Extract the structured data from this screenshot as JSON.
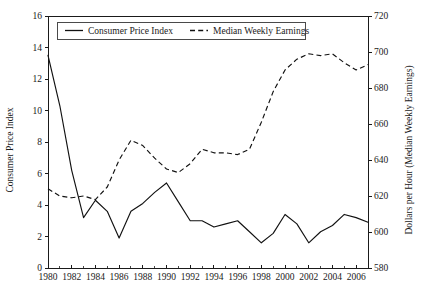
{
  "chart_data": {
    "type": "line",
    "title": "",
    "subtitle": "",
    "xlabel": "",
    "ylabel": "Consumer Price Index",
    "y2label": "Dollars per Hour (Median Weekly Earnings)",
    "grid": false,
    "legend_position": "top-center",
    "xlim": [
      1980,
      2007
    ],
    "ylim": [
      0,
      16
    ],
    "y2lim": [
      580,
      720
    ],
    "x_tick_labels": [
      "1980",
      "1982",
      "1984",
      "1986",
      "1988",
      "1990",
      "1992",
      "1994",
      "1996",
      "1998",
      "2000",
      "2002",
      "2004",
      "2006"
    ],
    "x_tick_values": [
      1980,
      1982,
      1984,
      1986,
      1988,
      1990,
      1992,
      1994,
      1996,
      1998,
      2000,
      2002,
      2004,
      2006
    ],
    "x_minor_tick_values": [
      1981,
      1983,
      1985,
      1987,
      1989,
      1991,
      1993,
      1995,
      1997,
      1999,
      2001,
      2003,
      2005,
      2007
    ],
    "y_tick_labels": [
      "0",
      "2",
      "4",
      "6",
      "8",
      "10",
      "12",
      "14",
      "16"
    ],
    "y_tick_values": [
      0,
      2,
      4,
      6,
      8,
      10,
      12,
      14,
      16
    ],
    "y2_tick_labels": [
      "580",
      "600",
      "620",
      "640",
      "660",
      "680",
      "700",
      "720"
    ],
    "y2_tick_values": [
      580,
      600,
      620,
      640,
      660,
      680,
      700,
      720
    ],
    "x": [
      1980,
      1981,
      1982,
      1983,
      1984,
      1985,
      1986,
      1987,
      1988,
      1989,
      1990,
      1991,
      1992,
      1993,
      1994,
      1995,
      1996,
      1997,
      1998,
      1999,
      2000,
      2001,
      2002,
      2003,
      2004,
      2005,
      2006,
      2007
    ],
    "series": [
      {
        "name": "Consumer Price Index",
        "axis": "left",
        "style": "solid",
        "values": [
          13.5,
          10.3,
          6.2,
          3.2,
          4.3,
          3.6,
          1.9,
          3.6,
          4.1,
          4.8,
          5.4,
          4.2,
          3.0,
          3.0,
          2.6,
          2.8,
          3.0,
          2.3,
          1.6,
          2.2,
          3.4,
          2.8,
          1.6,
          2.3,
          2.7,
          3.4,
          3.2,
          2.9
        ]
      },
      {
        "name": "Median Weekly Earnings",
        "axis": "right",
        "style": "dashed",
        "values": [
          624.0,
          620.0,
          619.0,
          620.0,
          618.0,
          625.0,
          640.0,
          651.0,
          648.0,
          641.0,
          635.0,
          633.0,
          638.0,
          646.0,
          644.0,
          644.0,
          643.0,
          646.0,
          661.0,
          678.0,
          690.0,
          696.0,
          699.0,
          698.0,
          699.0,
          694.0,
          690.0,
          693.0
        ]
      }
    ],
    "legend": [
      {
        "label": "Consumer Price Index",
        "style": "solid"
      },
      {
        "label": "Median Weekly Earnings",
        "style": "dashed"
      }
    ]
  }
}
